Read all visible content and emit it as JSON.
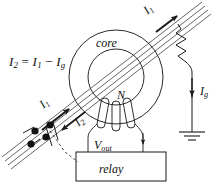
{
  "figure": {
    "background_color": "#ffffff",
    "line_color": "#1a1a1a",
    "text_color": "#111111"
  },
  "labels": {
    "equation": {
      "full": "I2 = I1 - Ig",
      "lhs_symbol": "I",
      "lhs_sub": "2",
      "equals": "=",
      "term1_symbol": "I",
      "term1_sub": "1",
      "minus": "−",
      "term2_symbol": "I",
      "term2_sub": "g"
    },
    "core": "core",
    "winding_turns": "N",
    "output_voltage": {
      "symbol": "V",
      "sub": "out"
    },
    "relay": "relay",
    "current_primary_top": {
      "symbol": "I",
      "sub": "1"
    },
    "current_primary_bottom": {
      "symbol": "I",
      "sub": "1"
    },
    "current_return_bottom": {
      "symbol": "I",
      "sub": "2"
    },
    "ground_current": {
      "symbol": "I",
      "sub": "g"
    }
  },
  "components": {
    "toroid_core": {
      "name": "toroidal current transformer core",
      "center_x": 116,
      "center_y": 77,
      "outer_radius": 47,
      "inner_radius": 28
    },
    "secondary_winding": {
      "name": "secondary winding N turns",
      "turn_count": 3
    },
    "relay_box": {
      "name": "relay",
      "x": 76,
      "y": 152,
      "width": 90,
      "height": 29
    },
    "resistor": {
      "name": "fault resistance zigzag",
      "zigzag_segments": 4
    },
    "ground_symbol": {
      "name": "earth ground",
      "bar_count": 3
    },
    "switch_contacts": {
      "name": "relay operated contacts",
      "dot_count": 4
    },
    "conductor_cable": {
      "name": "primary conductor bundle",
      "line_count": 4
    },
    "mechanical_link": {
      "name": "dashed mechanical linkage",
      "style": "dashed"
    }
  }
}
